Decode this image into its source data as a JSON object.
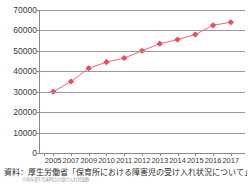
{
  "chart_data": {
    "type": "line",
    "title": "",
    "subtitle": "",
    "xlabel": "",
    "ylabel": "",
    "categories": [
      "2005",
      "2007",
      "2009",
      "2010",
      "2011",
      "2012",
      "2013",
      "2014",
      "2015",
      "2016",
      "2017"
    ],
    "series": [
      {
        "name": "保育所における障害児の受け入れ児童数",
        "color": "#ef4b5e",
        "marker": "diamond",
        "values": [
          30000,
          35000,
          41500,
          44500,
          46500,
          50000,
          53500,
          55500,
          58000,
          62500,
          64000
        ]
      }
    ],
    "ylim": [
      0,
      70000
    ],
    "ytick_labels": [
      "0",
      "10000",
      "20000",
      "30000",
      "40000",
      "50000",
      "60000",
      "70000"
    ],
    "ytick_values": [
      0,
      10000,
      20000,
      30000,
      40000,
      50000,
      60000,
      70000
    ],
    "grid": true,
    "grid_axis": "y",
    "legend": false,
    "legend_position": "none"
  },
  "caption": {
    "source_text": "資料：厚生労働省「保育所における障害児の受け入れ状況について」",
    "sub_text": "※各年度3月末時点の受け入れ児童数"
  },
  "colors": {
    "series": "#ef4b5e",
    "grid": "#9a9a9a",
    "axis": "#8a8a8a",
    "text": "#3a3a3a",
    "background": "#ffffff"
  }
}
